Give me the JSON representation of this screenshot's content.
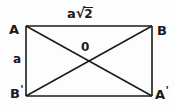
{
  "figure": {
    "type": "geometry-diagram",
    "shape": "rectangle-with-diagonals",
    "background_color": "#fdfdfd",
    "stroke_color": "#1a1a1a",
    "vertices": {
      "top_left": "A",
      "top_right": "B",
      "bottom_left_base": "B",
      "bottom_left_prime": "'",
      "bottom_right_base": "A",
      "bottom_right_prime": "'",
      "center": "0"
    },
    "measurements": {
      "side_label": "a",
      "diagonal_label_base": "a",
      "radical_sign": "√",
      "radicand": "2"
    }
  }
}
